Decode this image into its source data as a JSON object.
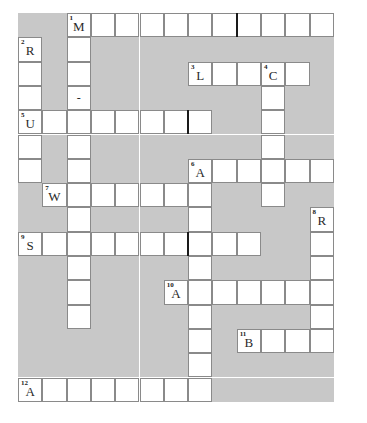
{
  "puzzle": {
    "kind": "crossword-grid",
    "rows": 16,
    "cols": 13,
    "cell_size_px": 24.3,
    "origin": {
      "x": 18,
      "y": 13
    },
    "colors": {
      "block": "#c8c8c8",
      "open": "#ffffff",
      "grid_line": "#8a8a8a",
      "divider": "#1a1a1a",
      "text": "#2a2a2a",
      "page": "#ffffff"
    },
    "entries": [
      {
        "number": "1",
        "letter": "M",
        "row": 0,
        "col": 2,
        "direction": "across",
        "length": 11
      },
      {
        "number": "1",
        "letter": "M",
        "row": 0,
        "col": 2,
        "direction": "down",
        "length": 11
      },
      {
        "number": "2",
        "letter": "R",
        "row": 1,
        "col": 0,
        "direction": "down",
        "length": 5
      },
      {
        "number": "3",
        "letter": "L",
        "row": 2,
        "col": 7,
        "direction": "across",
        "length": 5
      },
      {
        "number": "4",
        "letter": "C",
        "row": 2,
        "col": 10,
        "direction": "down",
        "length": 6
      },
      {
        "number": "5",
        "letter": "U",
        "row": 4,
        "col": 0,
        "direction": "across",
        "length": 8
      },
      {
        "number": "6",
        "letter": "A",
        "row": 6,
        "col": 7,
        "direction": "across",
        "length": 6
      },
      {
        "number": "6",
        "letter": "A",
        "row": 6,
        "col": 7,
        "direction": "down",
        "length": 10
      },
      {
        "number": "7",
        "letter": "W",
        "row": 7,
        "col": 1,
        "direction": "across",
        "length": 7
      },
      {
        "number": "8",
        "letter": "R",
        "row": 8,
        "col": 12,
        "direction": "down",
        "length": 6
      },
      {
        "number": "9",
        "letter": "S",
        "row": 9,
        "col": 0,
        "direction": "across",
        "length": 10
      },
      {
        "number": "10",
        "letter": "A",
        "row": 11,
        "col": 6,
        "direction": "across",
        "length": 6
      },
      {
        "number": "11",
        "letter": "B",
        "row": 13,
        "col": 9,
        "direction": "across",
        "length": 4
      },
      {
        "number": "12",
        "letter": "A",
        "row": 15,
        "col": 0,
        "direction": "across",
        "length": 8
      }
    ],
    "open_cells": [
      {
        "row": 0,
        "col": 2,
        "number": "1",
        "letter": "M"
      },
      {
        "row": 0,
        "col": 3
      },
      {
        "row": 0,
        "col": 4
      },
      {
        "row": 0,
        "col": 5
      },
      {
        "row": 0,
        "col": 6
      },
      {
        "row": 0,
        "col": 7
      },
      {
        "row": 0,
        "col": 8
      },
      {
        "row": 0,
        "col": 9
      },
      {
        "row": 0,
        "col": 10
      },
      {
        "row": 0,
        "col": 11
      },
      {
        "row": 0,
        "col": 12
      },
      {
        "row": 1,
        "col": 0,
        "number": "2",
        "letter": "R"
      },
      {
        "row": 1,
        "col": 2
      },
      {
        "row": 2,
        "col": 0
      },
      {
        "row": 2,
        "col": 2
      },
      {
        "row": 2,
        "col": 7,
        "number": "3",
        "letter": "L"
      },
      {
        "row": 2,
        "col": 8
      },
      {
        "row": 2,
        "col": 9
      },
      {
        "row": 2,
        "col": 10,
        "number": "4",
        "letter": "C"
      },
      {
        "row": 2,
        "col": 11
      },
      {
        "row": 3,
        "col": 0
      },
      {
        "row": 3,
        "col": 2,
        "letter": "-"
      },
      {
        "row": 3,
        "col": 10
      },
      {
        "row": 4,
        "col": 0,
        "number": "5",
        "letter": "U"
      },
      {
        "row": 4,
        "col": 1
      },
      {
        "row": 4,
        "col": 2
      },
      {
        "row": 4,
        "col": 3
      },
      {
        "row": 4,
        "col": 4
      },
      {
        "row": 4,
        "col": 5
      },
      {
        "row": 4,
        "col": 6
      },
      {
        "row": 4,
        "col": 7
      },
      {
        "row": 4,
        "col": 10
      },
      {
        "row": 5,
        "col": 0
      },
      {
        "row": 5,
        "col": 2
      },
      {
        "row": 5,
        "col": 10
      },
      {
        "row": 6,
        "col": 0
      },
      {
        "row": 6,
        "col": 2
      },
      {
        "row": 6,
        "col": 7,
        "number": "6",
        "letter": "A"
      },
      {
        "row": 6,
        "col": 8
      },
      {
        "row": 6,
        "col": 9
      },
      {
        "row": 6,
        "col": 10
      },
      {
        "row": 6,
        "col": 11
      },
      {
        "row": 6,
        "col": 12
      },
      {
        "row": 7,
        "col": 1,
        "number": "7",
        "letter": "W"
      },
      {
        "row": 7,
        "col": 2
      },
      {
        "row": 7,
        "col": 3
      },
      {
        "row": 7,
        "col": 4
      },
      {
        "row": 7,
        "col": 5
      },
      {
        "row": 7,
        "col": 6
      },
      {
        "row": 7,
        "col": 7
      },
      {
        "row": 7,
        "col": 10
      },
      {
        "row": 8,
        "col": 2
      },
      {
        "row": 8,
        "col": 7
      },
      {
        "row": 8,
        "col": 12,
        "number": "8",
        "letter": "R"
      },
      {
        "row": 9,
        "col": 0,
        "number": "9",
        "letter": "S"
      },
      {
        "row": 9,
        "col": 1
      },
      {
        "row": 9,
        "col": 2
      },
      {
        "row": 9,
        "col": 3
      },
      {
        "row": 9,
        "col": 4
      },
      {
        "row": 9,
        "col": 5
      },
      {
        "row": 9,
        "col": 6
      },
      {
        "row": 9,
        "col": 7
      },
      {
        "row": 9,
        "col": 8
      },
      {
        "row": 9,
        "col": 9
      },
      {
        "row": 9,
        "col": 12
      },
      {
        "row": 10,
        "col": 2
      },
      {
        "row": 10,
        "col": 7
      },
      {
        "row": 10,
        "col": 12
      },
      {
        "row": 11,
        "col": 2
      },
      {
        "row": 11,
        "col": 6,
        "number": "10",
        "letter": "A"
      },
      {
        "row": 11,
        "col": 7
      },
      {
        "row": 11,
        "col": 8
      },
      {
        "row": 11,
        "col": 9
      },
      {
        "row": 11,
        "col": 10
      },
      {
        "row": 11,
        "col": 11
      },
      {
        "row": 11,
        "col": 12
      },
      {
        "row": 12,
        "col": 2
      },
      {
        "row": 12,
        "col": 7
      },
      {
        "row": 12,
        "col": 12
      },
      {
        "row": 13,
        "col": 7
      },
      {
        "row": 13,
        "col": 9,
        "number": "11",
        "letter": "B"
      },
      {
        "row": 13,
        "col": 10
      },
      {
        "row": 13,
        "col": 11
      },
      {
        "row": 13,
        "col": 12
      },
      {
        "row": 14,
        "col": 7
      },
      {
        "row": 15,
        "col": 0,
        "number": "12",
        "letter": "A"
      },
      {
        "row": 15,
        "col": 1
      },
      {
        "row": 15,
        "col": 2
      },
      {
        "row": 15,
        "col": 3
      },
      {
        "row": 15,
        "col": 4
      },
      {
        "row": 15,
        "col": 5
      },
      {
        "row": 15,
        "col": 6
      },
      {
        "row": 15,
        "col": 7
      }
    ],
    "dividers": [
      {
        "row": 0,
        "col": 8,
        "note": "word separator in 1-across"
      },
      {
        "row": 4,
        "col": 6,
        "note": "word separator in 5-across"
      },
      {
        "row": 9,
        "col": 6,
        "note": "word separator in 9-across"
      }
    ],
    "block_region": {
      "row_start": 0,
      "row_end": 15,
      "col_start": 0,
      "col_end": 12,
      "note": "grey background fills all non-open cells"
    }
  }
}
